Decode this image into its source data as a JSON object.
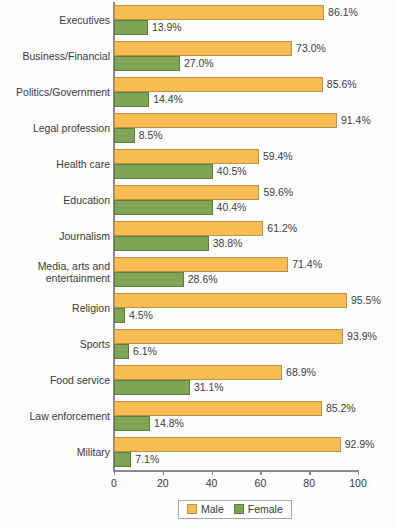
{
  "chart_data": {
    "type": "bar",
    "title": "",
    "subtitle": "",
    "xlabel": "",
    "ylabel": "",
    "orientation": "horizontal",
    "grid": false,
    "legend_position": "bottom",
    "xlim": [
      0,
      100
    ],
    "xticks": [
      0,
      20,
      40,
      60,
      80,
      100
    ],
    "xtick_labels": [
      "0",
      "20",
      "40",
      "60",
      "80",
      "100"
    ],
    "value_suffix": "%",
    "categories": [
      "Executives",
      "Business/Financial",
      "Politics/Government",
      "Legal profession",
      "Health care",
      "Education",
      "Journalism",
      "Media, arts and\nentertainment",
      "Religion",
      "Sports",
      "Food service",
      "Law enforcement",
      "Military"
    ],
    "series": [
      {
        "name": "Male",
        "color": "#f6be50",
        "values": [
          86.1,
          73.0,
          85.6,
          91.4,
          59.4,
          59.6,
          61.2,
          71.4,
          95.5,
          93.9,
          68.9,
          85.2,
          92.9
        ],
        "labels": [
          "86.1%",
          "73.0%",
          "85.6%",
          "91.4%",
          "59.4%",
          "59.6%",
          "61.2%",
          "71.4%",
          "95.5%",
          "93.9%",
          "68.9%",
          "85.2%",
          "92.9%"
        ]
      },
      {
        "name": "Female",
        "color": "#7fa453",
        "values": [
          13.9,
          27.0,
          14.4,
          8.5,
          40.5,
          40.4,
          38.8,
          28.6,
          4.5,
          6.1,
          31.1,
          14.8,
          7.1
        ],
        "labels": [
          "13.9%",
          "27.0%",
          "14.4%",
          "8.5%",
          "40.5%",
          "40.4%",
          "38.8%",
          "28.6%",
          "4.5%",
          "6.1%",
          "31.1%",
          "14.8%",
          "7.1%"
        ]
      }
    ]
  },
  "legend": {
    "items": [
      {
        "label": "Male",
        "color": "#f6be50"
      },
      {
        "label": "Female",
        "color": "#7fa453"
      }
    ]
  }
}
